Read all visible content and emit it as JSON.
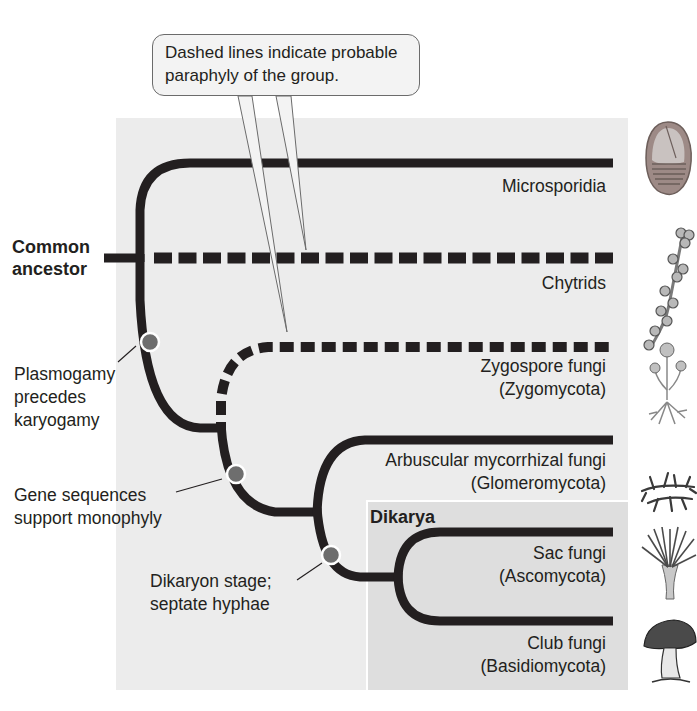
{
  "callout": {
    "line1": "Dashed lines indicate probable",
    "line2": "paraphyly of the group."
  },
  "root": {
    "line1": "Common",
    "line2": "ancestor"
  },
  "taxa": [
    {
      "name": "Microsporidia",
      "sub": "",
      "line_style": "solid",
      "icon": "microsporidia-spore-icon"
    },
    {
      "name": "Chytrids",
      "sub": "",
      "line_style": "dashed",
      "icon": "chytrid-icon"
    },
    {
      "name": "Zygospore fungi",
      "sub": "(Zygomycota)",
      "line_style": "dashed",
      "icon": "zygospore-fungus-icon"
    },
    {
      "name": "Arbuscular mycorrhizal fungi",
      "sub": "(Glomeromycota)",
      "line_style": "solid",
      "icon": "mycorrhizal-fungus-icon"
    },
    {
      "name": "Sac fungi",
      "sub": "(Ascomycota)",
      "line_style": "solid",
      "icon": "sac-fungus-icon"
    },
    {
      "name": "Club fungi",
      "sub": "(Basidiomycota)",
      "line_style": "solid",
      "icon": "mushroom-icon"
    }
  ],
  "group_box": {
    "label": "Dikarya"
  },
  "events": [
    {
      "line1": "Plasmogamy",
      "line2": "precedes",
      "line3": "karyogamy"
    },
    {
      "line1": "Gene sequences",
      "line2": "support monophyly"
    },
    {
      "line1": "Dikaryon stage;",
      "line2": "septate hyphae"
    }
  ],
  "colors": {
    "branch": "#231f20",
    "node": "#6e6e6e",
    "panel": "#ececec",
    "dikarya_panel": "#dedede"
  }
}
